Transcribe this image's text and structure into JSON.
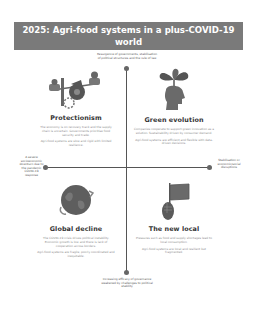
{
  "_note": "Title and quadrant headings are legible in the source. Body paragraphs and axis labels are too blurry to read exactly at 253x311; those strings are approximate reconstructions, not verified transcriptions.",
  "title": "2025: Agri-food systems in a plus-COVID-19 world",
  "axes": {
    "top": "Resurgence of governments, stabilisation of political structures and the rule of law",
    "bottom": "Increasing efficacy of governance weakened by challenges to political stability",
    "left": "A severe socioeconomic downturn due to the pandemic COVID-19 response",
    "right": "Stabilisation or economic/social disruptions"
  },
  "quadrants": [
    {
      "id": "protectionism",
      "heading": "Protectionism",
      "icon": "scales-gears-icon",
      "paragraphs": [
        "The economy is on recovery track and the supply chain is uncertain. Governments prioritise food security and trade.",
        "Agri-food systems are slow and rigid with limited resilience."
      ]
    },
    {
      "id": "green-evolution",
      "heading": "Green evolution",
      "icon": "head-plant-icon",
      "paragraphs": [
        "Companies cooperate to support green innovation as a solution. Sustainability driven by consumer demand.",
        "Agri-food systems are efficient and flexible with data-driven decisions."
      ]
    },
    {
      "id": "global-decline",
      "heading": "Global decline",
      "icon": "globe-icon",
      "paragraphs": [
        "The COVID-19 crisis drives political instability. Economic growth is low and there is lack of cooperation across borders.",
        "Agri-food systems are fragile, poorly coordinated and inequitable."
      ]
    },
    {
      "id": "the-new-local",
      "heading": "The new local",
      "icon": "hand-flag-icon",
      "paragraphs": [
        "Pressures such as food and supply shortages lead to local consumption.",
        "Agri-food systems are local and resilient but fragmented."
      ]
    }
  ],
  "colors": {
    "title_bg": "#7a7a7a",
    "title_text": "#ffffff",
    "axis": "#555555",
    "heading": "#333333",
    "body": "#8a8a8a"
  }
}
